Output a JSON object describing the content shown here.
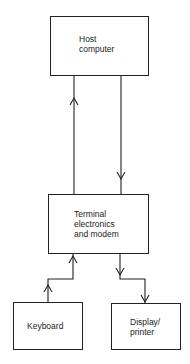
{
  "diagram": {
    "nodes": [
      {
        "id": "host",
        "label": "Host\ncomputer"
      },
      {
        "id": "terminal",
        "label": "Terminal\nelectronics\nand modem"
      },
      {
        "id": "keyboard",
        "label": "Keyboard"
      },
      {
        "id": "display",
        "label": "Display/\nprinter"
      }
    ],
    "edges": [
      {
        "from": "terminal",
        "to": "host",
        "direction": "up"
      },
      {
        "from": "host",
        "to": "terminal",
        "direction": "down"
      },
      {
        "from": "keyboard",
        "to": "terminal",
        "direction": "up"
      },
      {
        "from": "terminal",
        "to": "display",
        "direction": "down"
      }
    ],
    "colors": {
      "line": "#222222",
      "background": "#ffffff"
    }
  }
}
